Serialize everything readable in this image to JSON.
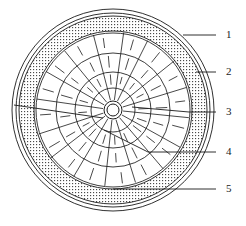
{
  "figure": {
    "kind": "technical-line-drawing",
    "background_color": "#ffffff",
    "line_color": "#1a1a1a",
    "stipple_color": "#3a3a3a",
    "canvas": {
      "width": 246,
      "height": 226
    }
  },
  "geometry": {
    "center": {
      "cx": 113,
      "cy": 110
    },
    "rings": [
      {
        "name": "outer-rim-outer-edge",
        "r": 101
      },
      {
        "name": "outer-rim-inner-edge",
        "r": 97
      },
      {
        "name": "stipple-band-outer-edge",
        "r": 94
      },
      {
        "name": "stipple-band-inner-edge",
        "r": 79
      },
      {
        "name": "ring-4",
        "r": 77
      },
      {
        "name": "ring-3",
        "r": 57
      },
      {
        "name": "ring-2",
        "r": 38
      },
      {
        "name": "ring-1",
        "r": 22
      },
      {
        "name": "hub-outer",
        "r": 9
      },
      {
        "name": "hub-inner",
        "r": 6
      }
    ],
    "spoke_count": 16,
    "spoke_start_angle_deg": -84,
    "tick_count": 16,
    "hatch_spacing": 3
  },
  "callouts": [
    {
      "id": "callout-1",
      "label": "1",
      "label_x": 226,
      "label_y": 29,
      "line_x1": 216,
      "line_y1": 35,
      "line_x2": 183,
      "line_y2": 35
    },
    {
      "id": "callout-2",
      "label": "2",
      "label_x": 226,
      "label_y": 66,
      "line_x1": 216,
      "line_y1": 72,
      "line_x2": 196,
      "line_y2": 72
    },
    {
      "id": "callout-3",
      "label": "3",
      "label_x": 226,
      "label_y": 106,
      "line_x1": 216,
      "line_y1": 112,
      "line_x2": 189,
      "line_y2": 112
    },
    {
      "id": "callout-4",
      "label": "4",
      "label_x": 226,
      "label_y": 146,
      "line_x1": 216,
      "line_y1": 152,
      "line_x2": 148,
      "line_y2": 152
    },
    {
      "id": "callout-5",
      "label": "5",
      "label_x": 226,
      "label_y": 183,
      "line_x1": 216,
      "line_y1": 189,
      "line_x2": 113,
      "line_y2": 189
    }
  ],
  "inner_leaders": [
    {
      "id": "inner-leader-3",
      "x1": 189,
      "y1": 112,
      "x2": 132,
      "y2": 107
    },
    {
      "id": "inner-leader-left",
      "x1": 14,
      "y1": 105,
      "x2": 103,
      "y2": 118
    },
    {
      "id": "inner-leader-4",
      "x1": 148,
      "y1": 152,
      "x2": 104,
      "y2": 130
    }
  ]
}
